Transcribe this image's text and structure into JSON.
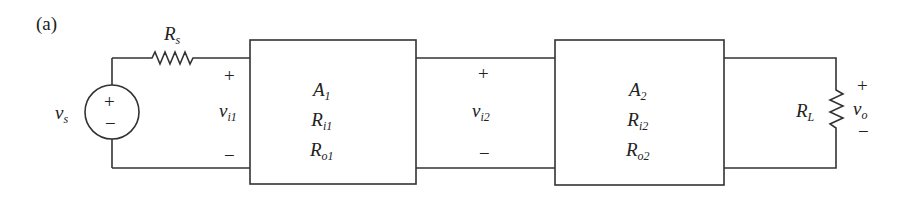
{
  "figure": {
    "label": "(a)",
    "source": {
      "name": "v",
      "sub": "s",
      "plus": "+",
      "minus": "−"
    },
    "source_resistor": {
      "name": "R",
      "sub": "s"
    },
    "input1": {
      "plus": "+",
      "name": "v",
      "sub": "i1",
      "minus": "−"
    },
    "stage1": {
      "gain": "A",
      "gain_sub": "1",
      "rin": "R",
      "rin_sub": "i1",
      "rout": "R",
      "rout_sub": "o1"
    },
    "input2": {
      "plus": "+",
      "name": "v",
      "sub": "i2",
      "minus": "−"
    },
    "stage2": {
      "gain": "A",
      "gain_sub": "2",
      "rin": "R",
      "rin_sub": "i2",
      "rout": "R",
      "rout_sub": "o2"
    },
    "load": {
      "name": "R",
      "sub": "L"
    },
    "output": {
      "plus": "+",
      "name": "v",
      "sub": "o",
      "minus": "−"
    }
  }
}
